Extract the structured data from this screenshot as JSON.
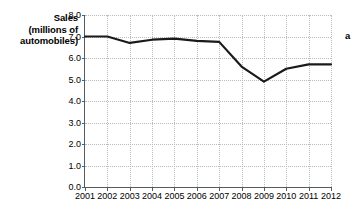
{
  "chart_data": {
    "type": "line",
    "title": "",
    "ylabel": "Sales (millions of automobiles)",
    "ylabel_lines": [
      "Sales",
      "(millions of",
      "automobiles)"
    ],
    "xlabel": "",
    "x": [
      2001,
      2002,
      2003,
      2004,
      2005,
      2006,
      2007,
      2008,
      2009,
      2010,
      2011,
      2012
    ],
    "categories": [
      "2001",
      "2002",
      "2003",
      "2004",
      "2005",
      "2006",
      "2007",
      "2008",
      "2009",
      "2010",
      "2011",
      "2012"
    ],
    "values": [
      7.0,
      7.0,
      6.7,
      6.85,
      6.9,
      6.8,
      6.75,
      5.6,
      4.9,
      5.5,
      5.7,
      5.7
    ],
    "xlim": [
      2001,
      2012
    ],
    "ylim": [
      0.0,
      8.0
    ],
    "ytick_labels": [
      "0.0",
      "1.0",
      "2.0",
      "3.0",
      "4.0",
      "5.0",
      "6.0",
      "7.0",
      "8.0"
    ],
    "ytick_values": [
      0.0,
      1.0,
      2.0,
      3.0,
      4.0,
      5.0,
      6.0,
      7.0,
      8.0
    ],
    "grid": true,
    "grid_style": "dotted",
    "legend": false,
    "legend_position": "none",
    "line_color": "#1a1a1a",
    "line_width": 2.2,
    "grid_color": "#b9bcbe",
    "axis_color": "#555c5e",
    "background": "#ffffff",
    "annotations": [
      {
        "text": "a",
        "position": "right-of-plot"
      }
    ]
  },
  "annotation": {
    "label_a": "a"
  }
}
